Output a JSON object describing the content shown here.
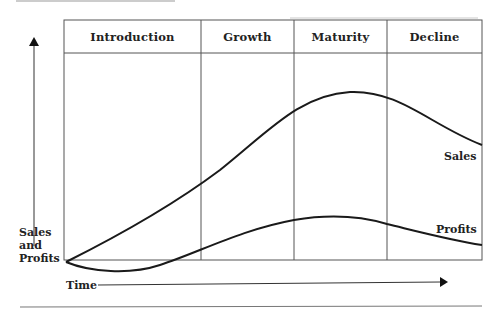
{
  "diagram": {
    "stages": [
      {
        "label": "Introduction"
      },
      {
        "label": "Growth"
      },
      {
        "label": "Maturity"
      },
      {
        "label": "Decline"
      }
    ],
    "y_axis_label": [
      "Sales",
      "and",
      "Profits"
    ],
    "x_axis_label": "Time",
    "curves": [
      {
        "name": "Sales",
        "label": "Sales"
      },
      {
        "name": "Profits",
        "label": "Profits"
      }
    ],
    "colors": {
      "line": "#1a1a1a",
      "grid": "#555555",
      "rule": "#777777"
    }
  }
}
